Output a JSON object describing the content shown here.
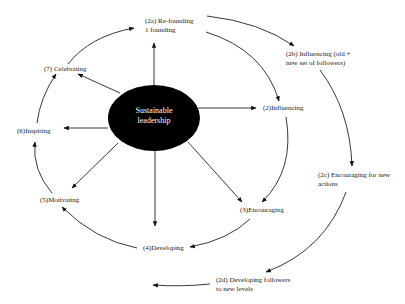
{
  "diagram": {
    "center": {
      "line1": "Sustainable",
      "line2": "leadership"
    },
    "inner_cycle": [
      {
        "id": "2",
        "label": "(2)Influencing"
      },
      {
        "id": "3",
        "label": "(3)Encouraging"
      },
      {
        "id": "4",
        "label": "(4)Developing"
      },
      {
        "id": "5",
        "label": "(5)Motivating"
      },
      {
        "id": "6",
        "label": "(6)Inspiring"
      },
      {
        "id": "7",
        "label": "(7) Celebrating"
      }
    ],
    "outer_cycle": [
      {
        "id": "2a",
        "line1": "(2a) Re-founding",
        "line2": "1 founding"
      },
      {
        "id": "2b",
        "line1": "(2b) Influencing (old +",
        "line2": "new set of followers)"
      },
      {
        "id": "2c",
        "line1": "(2c) Encouraging for new",
        "line2": "actions"
      },
      {
        "id": "2d",
        "line1": "(2d) Developing followers",
        "line2": "to new levels"
      }
    ],
    "colors": {
      "ellipse": "#000000",
      "lines": "#222222",
      "text": "#222222",
      "background": "#ffffff"
    }
  }
}
